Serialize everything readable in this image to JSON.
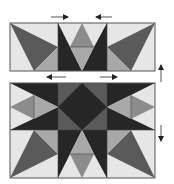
{
  "diagram": {
    "colors": {
      "light": "#e6e6e6",
      "medium_light": "#a8a8a8",
      "medium": "#8c8c8c",
      "dark_gray": "#5a5a5a",
      "dark": "#333333",
      "black": "#262626",
      "outline": "#555555",
      "arrow": "#222222"
    },
    "panels": [
      {
        "name": "top-row",
        "x": 10,
        "y": 23,
        "width": 145,
        "height": 48
      },
      {
        "name": "bottom-block",
        "x": 10,
        "y": 83,
        "width": 145,
        "height": 95
      }
    ],
    "arrows": [
      {
        "name": "press-right-top",
        "direction": "right",
        "x1": 51,
        "y1": 17,
        "x2": 68,
        "y2": 17
      },
      {
        "name": "press-left-top",
        "direction": "left",
        "x1": 112,
        "y1": 17,
        "x2": 96,
        "y2": 17
      },
      {
        "name": "press-left-middle",
        "direction": "left",
        "x1": 66,
        "y1": 77,
        "x2": 47,
        "y2": 77
      },
      {
        "name": "press-right-middle",
        "direction": "right",
        "x1": 100,
        "y1": 77,
        "x2": 117,
        "y2": 77
      },
      {
        "name": "press-up-side",
        "direction": "up",
        "x1": 161,
        "y1": 82,
        "x2": 161,
        "y2": 65
      },
      {
        "name": "press-down-side",
        "direction": "down",
        "x1": 161,
        "y1": 125,
        "x2": 161,
        "y2": 141
      }
    ]
  }
}
